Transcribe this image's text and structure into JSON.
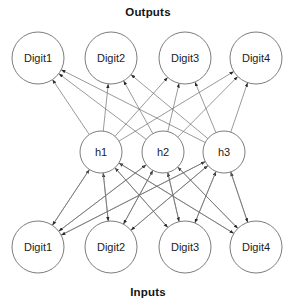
{
  "diagram": {
    "title_top": "Outputs",
    "title_bottom": "Inputs",
    "background_color": "#ffffff",
    "node_stroke_color": "#7d7d7d",
    "edge_color": "#6f6f6f",
    "text_color": "#1c1c1c"
  },
  "chart_data": {
    "type": "diagram",
    "subtype": "neural-network-graph",
    "title": "Outputs",
    "bottom_title": "Inputs",
    "layers": [
      {
        "id": "outputs",
        "name": "Outputs",
        "y": 58,
        "radius": 26,
        "nodes": [
          {
            "id": "out1",
            "label": "Digit1",
            "x": 38,
            "y": 58
          },
          {
            "id": "out2",
            "label": "Digit2",
            "x": 111,
            "y": 58
          },
          {
            "id": "out3",
            "label": "Digit3",
            "x": 185,
            "y": 58
          },
          {
            "id": "out4",
            "label": "Digit4",
            "x": 256,
            "y": 58
          }
        ]
      },
      {
        "id": "hidden",
        "name": "Hidden",
        "y": 152,
        "radius": 21,
        "nodes": [
          {
            "id": "h1",
            "label": "h1",
            "x": 101,
            "y": 152
          },
          {
            "id": "h2",
            "label": "h2",
            "x": 163,
            "y": 152
          },
          {
            "id": "h3",
            "label": "h3",
            "x": 224,
            "y": 152
          }
        ]
      },
      {
        "id": "inputs",
        "name": "Inputs",
        "y": 247,
        "radius": 26,
        "nodes": [
          {
            "id": "in1",
            "label": "Digit1",
            "x": 38,
            "y": 247
          },
          {
            "id": "in2",
            "label": "Digit2",
            "x": 111,
            "y": 247
          },
          {
            "id": "in3",
            "label": "Digit3",
            "x": 185,
            "y": 247
          },
          {
            "id": "in4",
            "label": "Digit4",
            "x": 256,
            "y": 247
          }
        ]
      }
    ],
    "edges": [
      {
        "from": "h1",
        "to": "out1",
        "arrow": "to"
      },
      {
        "from": "h1",
        "to": "out2",
        "arrow": "to"
      },
      {
        "from": "h1",
        "to": "out3",
        "arrow": "to"
      },
      {
        "from": "h1",
        "to": "out4",
        "arrow": "to"
      },
      {
        "from": "h2",
        "to": "out1",
        "arrow": "to"
      },
      {
        "from": "h2",
        "to": "out2",
        "arrow": "to"
      },
      {
        "from": "h2",
        "to": "out3",
        "arrow": "to"
      },
      {
        "from": "h2",
        "to": "out4",
        "arrow": "to"
      },
      {
        "from": "h3",
        "to": "out1",
        "arrow": "to"
      },
      {
        "from": "h3",
        "to": "out2",
        "arrow": "to"
      },
      {
        "from": "h3",
        "to": "out3",
        "arrow": "to"
      },
      {
        "from": "h3",
        "to": "out4",
        "arrow": "to"
      },
      {
        "from": "in1",
        "to": "h1",
        "arrow": "both"
      },
      {
        "from": "in1",
        "to": "h2",
        "arrow": "both"
      },
      {
        "from": "in1",
        "to": "h3",
        "arrow": "both"
      },
      {
        "from": "in2",
        "to": "h1",
        "arrow": "both"
      },
      {
        "from": "in2",
        "to": "h2",
        "arrow": "both"
      },
      {
        "from": "in2",
        "to": "h3",
        "arrow": "both"
      },
      {
        "from": "in3",
        "to": "h1",
        "arrow": "both"
      },
      {
        "from": "in3",
        "to": "h2",
        "arrow": "both"
      },
      {
        "from": "in3",
        "to": "h3",
        "arrow": "both"
      },
      {
        "from": "in4",
        "to": "h1",
        "arrow": "both"
      },
      {
        "from": "in4",
        "to": "h2",
        "arrow": "both"
      },
      {
        "from": "in4",
        "to": "h3",
        "arrow": "both"
      }
    ],
    "title_positions": {
      "top": {
        "x": 148,
        "y": 16
      },
      "bottom": {
        "x": 148,
        "y": 296
      }
    }
  }
}
